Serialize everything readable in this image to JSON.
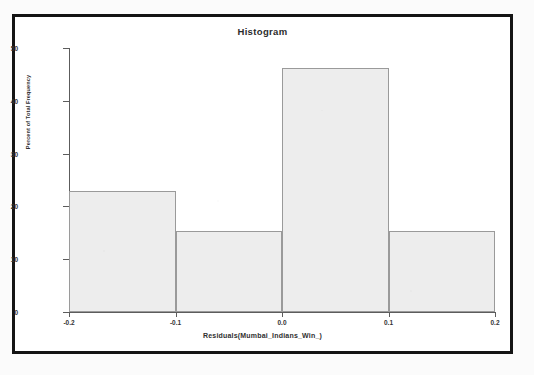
{
  "chart_data": {
    "type": "bar",
    "title": "Histogram",
    "xlabel": "Residuals(Mumbai_Indians_Win_)",
    "ylabel": "Percent of Total Frequency",
    "bin_edges": [
      -0.2,
      -0.1,
      0.0,
      0.1,
      0.2
    ],
    "categories": [
      "-0.2 to -0.1",
      "-0.1 to 0.0",
      "0.0 to 0.1",
      "0.1 to 0.2"
    ],
    "values": [
      23.0,
      15.4,
      46.2,
      15.4
    ],
    "xlim": [
      -0.2,
      0.2
    ],
    "ylim": [
      0,
      50
    ],
    "xticks": [
      -0.2,
      -0.1,
      0.0,
      0.1,
      0.2
    ],
    "xtick_labels": [
      "-0.2",
      "-0.1",
      "0.0",
      "0.1",
      "0.2"
    ],
    "yticks": [
      0,
      10,
      20,
      30,
      40,
      50
    ],
    "ytick_labels": [
      "0",
      "10",
      "20",
      "30",
      "40",
      "50"
    ],
    "grid": false,
    "legend": null,
    "bar_fill_color": "#ededed",
    "bar_edge_color": "#9a9a9a",
    "axis_color": "#5c5c5c",
    "frame_color": "#141414"
  }
}
